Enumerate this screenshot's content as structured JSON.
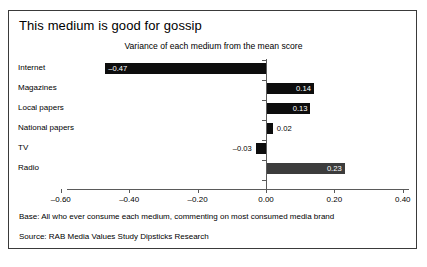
{
  "slide": {
    "title": "This medium is good for gossip",
    "subtitle": "Variance of each medium from the mean score",
    "footnote_base": "Base: All who ever consume each medium, commenting on most consumed media brand",
    "footnote_source": "Source: RAB Media Values Study Dipsticks Research",
    "border_color": "#3a3a3a",
    "bar_color": "#0d0d0d",
    "bar_color_highlight": "#3c3c3c"
  },
  "chart_data": {
    "type": "bar",
    "orientation": "horizontal",
    "title": "This medium is good for gossip",
    "subtitle": "Variance of each medium from the mean score",
    "xlabel": "",
    "ylabel": "",
    "xlim": [
      -0.6,
      0.4
    ],
    "grid": false,
    "legend": false,
    "categories": [
      "Internet",
      "Magazines",
      "Local papers",
      "National papers",
      "TV",
      "Radio"
    ],
    "values": [
      -0.47,
      0.14,
      0.13,
      0.02,
      -0.03,
      0.23
    ],
    "value_labels": [
      "–0.47",
      "0.14",
      "0.13",
      "0.02",
      "–0.03",
      "0.23"
    ],
    "tick_values": [
      -0.6,
      -0.4,
      -0.2,
      0.0,
      0.2,
      0.4
    ],
    "tick_labels": [
      "–0.60",
      "–0.40",
      "–0.20",
      "0.00",
      "0.20",
      "0.40"
    ],
    "series": [
      {
        "name": "Variance from mean score",
        "values": [
          -0.47,
          0.14,
          0.13,
          0.02,
          -0.03,
          0.23
        ]
      }
    ],
    "bars": [
      {
        "category": "Internet",
        "value": -0.47,
        "label": "–0.47",
        "label_position": "inside",
        "color": "#0d0d0d"
      },
      {
        "category": "Magazines",
        "value": 0.14,
        "label": "0.14",
        "label_position": "inside",
        "color": "#0d0d0d"
      },
      {
        "category": "Local papers",
        "value": 0.13,
        "label": "0.13",
        "label_position": "inside",
        "color": "#0d0d0d"
      },
      {
        "category": "National papers",
        "value": 0.02,
        "label": "0.02",
        "label_position": "outside",
        "color": "#0d0d0d"
      },
      {
        "category": "TV",
        "value": -0.03,
        "label": "–0.03",
        "label_position": "outside",
        "color": "#0d0d0d"
      },
      {
        "category": "Radio",
        "value": 0.23,
        "label": "0.23",
        "label_position": "inside",
        "color": "#3c3c3c"
      }
    ]
  }
}
